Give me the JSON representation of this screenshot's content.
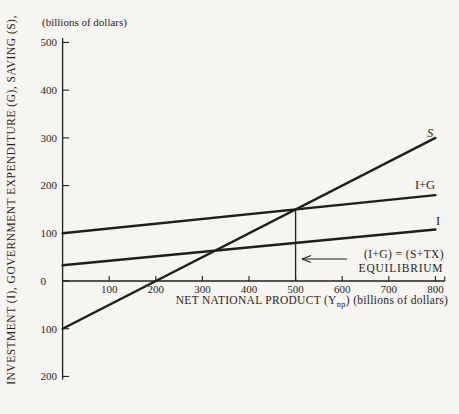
{
  "figure": {
    "background_color": "#f6f5f1",
    "ink_color": "#1f1e1c"
  },
  "chart_data": {
    "type": "line",
    "title": "",
    "grid": false,
    "legend": "labels at line ends",
    "x_axis": {
      "label_main": "NET NATIONAL PRODUCT (Y",
      "label_sub": "np",
      "label_tail": ") (billions of dollars)",
      "range": [
        0,
        820
      ],
      "ticks": [
        {
          "value": 100,
          "label": "100"
        },
        {
          "value": 200,
          "label": "200"
        },
        {
          "value": 300,
          "label": "300"
        },
        {
          "value": 400,
          "label": "400"
        },
        {
          "value": 500,
          "label": "500"
        },
        {
          "value": 600,
          "label": "600"
        },
        {
          "value": 700,
          "label": "700"
        },
        {
          "value": 800,
          "label": "800"
        }
      ]
    },
    "y_axis": {
      "label": "INVESTMENT (I), GOVERNMENT EXPENDITURE (G), SAVING (S),",
      "unit_label": "(billions of dollars)",
      "range": [
        -200,
        500
      ],
      "ticks": [
        {
          "value": 500,
          "label": "500"
        },
        {
          "value": 400,
          "label": "400"
        },
        {
          "value": 300,
          "label": "300"
        },
        {
          "value": 200,
          "label": "200"
        },
        {
          "value": 100,
          "label": "100"
        },
        {
          "value": 0,
          "label": "0"
        },
        {
          "value": -100,
          "label": "100"
        },
        {
          "value": -200,
          "label": "200"
        }
      ]
    },
    "series": [
      {
        "name": "saving",
        "label": "S",
        "points": [
          [
            0,
            -100
          ],
          [
            800,
            300
          ]
        ],
        "description": "Saving schedule: S = -100 + 0.5 Ynp, crosses zero at Ynp = 200"
      },
      {
        "name": "investment-plus-government",
        "label": "I+G",
        "points": [
          [
            0,
            100
          ],
          [
            800,
            180
          ]
        ],
        "description": "Investment plus government expenditure: rises from 100 to 180"
      },
      {
        "name": "investment",
        "label": "I",
        "points": [
          [
            0,
            33
          ],
          [
            800,
            108
          ]
        ],
        "description": "Investment schedule: rises from about 33 to about 108"
      }
    ],
    "equilibrium": {
      "x": 500,
      "y": 150,
      "annotation_line1": "(I+G) = (S+TX)",
      "annotation_line2": "EQUILIBRIUM"
    }
  }
}
